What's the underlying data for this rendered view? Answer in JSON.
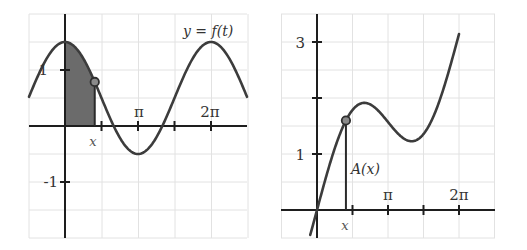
{
  "chart_data": [
    {
      "type": "line",
      "title": "y = f(t)",
      "function": "f(t) = 0.5 + cos(t)",
      "xlabel": "t",
      "ylabel": "y",
      "x_tick_labels": [
        "π",
        "2π"
      ],
      "x_ticks": [
        "π/2",
        "π",
        "3π/2",
        "2π"
      ],
      "y_tick_labels": [
        "1",
        "-1"
      ],
      "xlim": [
        -1.57,
        7.85
      ],
      "ylim": [
        -2.0,
        2.0
      ],
      "grid": true,
      "shaded_region": {
        "from": 0,
        "to": "x",
        "x_value": 1.28,
        "color": "#6b6b6b"
      },
      "marker": {
        "t": 1.28,
        "y": 0.79
      },
      "annotation": "x",
      "series": [
        {
          "name": "f(t)",
          "x": [
            -1.57,
            -0.79,
            0,
            0.79,
            1.57,
            2.36,
            3.14,
            3.93,
            4.71,
            5.5,
            6.28,
            7.07,
            7.85
          ],
          "values": [
            0.5,
            1.21,
            1.5,
            1.21,
            0.5,
            -0.21,
            -0.5,
            -0.21,
            0.5,
            1.21,
            1.5,
            1.21,
            0.5
          ]
        }
      ]
    },
    {
      "type": "line",
      "title": "A(x)",
      "function": "A(x) = 0.5x + sin(x)",
      "xlabel": "x",
      "ylabel": "",
      "x_tick_labels": [
        "π",
        "2π"
      ],
      "x_ticks": [
        "π/2",
        "π",
        "3π/2",
        "2π"
      ],
      "y_tick_labels": [
        "1",
        "3"
      ],
      "y_ticks": [
        1,
        2,
        3
      ],
      "xlim": [
        -1.57,
        7.85
      ],
      "ylim": [
        -0.5,
        3.5
      ],
      "grid": true,
      "marker": {
        "x": 1.28,
        "y": 1.6
      },
      "annotation": "A(x)",
      "series": [
        {
          "name": "A(x)",
          "x": [
            -0.3,
            0,
            0.79,
            1.57,
            2.09,
            2.36,
            3.14,
            3.93,
            4.19,
            4.71,
            5.5,
            6.28
          ],
          "values": [
            -0.45,
            0,
            1.1,
            1.79,
            1.91,
            1.89,
            1.57,
            1.26,
            1.23,
            1.36,
            2.04,
            3.14
          ]
        }
      ]
    }
  ],
  "left_graph": {
    "title_label": "y = f(t)",
    "y_labels": {
      "one": "1",
      "neg_one": "-1"
    },
    "x_labels": {
      "pi": "π",
      "two_pi": "2π"
    },
    "x_marker_label": "x"
  },
  "right_graph": {
    "y_labels": {
      "one": "1",
      "three": "3"
    },
    "x_labels": {
      "pi": "π",
      "two_pi": "2π"
    },
    "x_marker_label": "x",
    "area_label": "A(x)"
  },
  "colors": {
    "grid": "#e2e2e2",
    "axis": "#1e1e1e",
    "curve": "#3c3c3c",
    "shaded_area": "#6b6b6b",
    "marker_fill": "#8a8a8a"
  }
}
